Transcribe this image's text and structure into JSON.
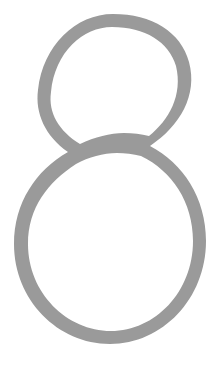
{
  "image": {
    "kind": "typographic-glyph",
    "character": "8",
    "character_name": "digit-eight",
    "style": "high-contrast modulated serif / didone",
    "orientation": "upright, upper bowl slightly tilted clockwise",
    "width": 219,
    "height": 366,
    "background_color": "#ffffff",
    "stroke_color": "#9a9a9a",
    "texture": "slightly grainy / scanned",
    "alt_text": "Large gray numeral 8"
  },
  "geometry": {
    "upper_bowl": {
      "shape": "teardrop / tilted oval",
      "left": 38,
      "right": 190,
      "top": 20,
      "bottom": 168,
      "apex_x": 113,
      "apex_y": 21
    },
    "lower_bowl": {
      "shape": "large rounded oval",
      "left": 18,
      "right": 205,
      "top": 150,
      "bottom": 338,
      "apex_x": 110,
      "apex_y": 338
    },
    "crossing": {
      "center_x": 106,
      "center_y": 156
    },
    "stroke_weight": {
      "thin_apex": 9,
      "thick_flank": 15
    }
  }
}
